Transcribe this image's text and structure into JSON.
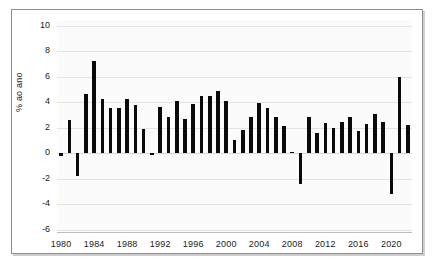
{
  "chart_data": {
    "type": "bar",
    "title": "",
    "subtitle": "",
    "xlabel": "",
    "ylabel": "% ao ano",
    "ylim": [
      -6,
      10
    ],
    "yticks": [
      10,
      8,
      6,
      4,
      2,
      0,
      -2,
      -4,
      -6
    ],
    "ytick_labels": [
      "10",
      "8",
      "6",
      "4",
      "2",
      "0",
      "-2",
      "-4",
      "-6"
    ],
    "xticks": [
      1980,
      1984,
      1988,
      1992,
      1996,
      2000,
      2004,
      2008,
      2012,
      2016,
      2020
    ],
    "xtick_labels": [
      "1980",
      "1984",
      "1988",
      "1992",
      "1996",
      "2000",
      "2004",
      "2008",
      "2012",
      "2016",
      "2020"
    ],
    "grid": "horizontal",
    "legend": "none",
    "bar_color": "#0a0a0a",
    "categories": [
      "1980",
      "1981",
      "1982",
      "1983",
      "1984",
      "1985",
      "1986",
      "1987",
      "1988",
      "1989",
      "1990",
      "1991",
      "1992",
      "1993",
      "1994",
      "1995",
      "1996",
      "1997",
      "1998",
      "1999",
      "2000",
      "2001",
      "2002",
      "2003",
      "2004",
      "2005",
      "2006",
      "2007",
      "2008",
      "2009",
      "2010",
      "2011",
      "2012",
      "2013",
      "2014",
      "2015",
      "2016",
      "2017",
      "2018",
      "2019",
      "2020",
      "2021",
      "2022"
    ],
    "values": [
      -0.2,
      2.6,
      -1.8,
      4.6,
      7.2,
      4.2,
      3.5,
      3.5,
      4.2,
      3.75,
      1.9,
      -0.1,
      3.6,
      2.8,
      4.05,
      2.7,
      3.85,
      4.45,
      4.5,
      4.85,
      4.1,
      1.05,
      1.8,
      2.85,
      3.9,
      3.55,
      2.8,
      2.1,
      0.1,
      -2.45,
      2.85,
      1.6,
      2.35,
      1.95,
      2.4,
      2.8,
      1.75,
      2.3,
      3.05,
      2.4,
      -3.25,
      6.0,
      2.2
    ]
  }
}
